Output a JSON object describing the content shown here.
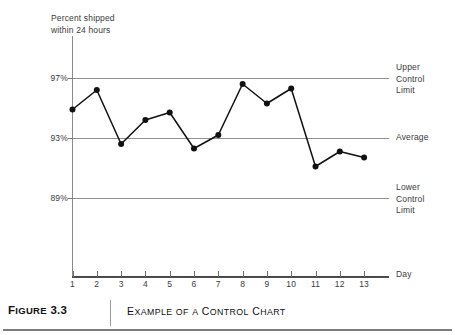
{
  "figure": {
    "number_label": "Figure 3.3",
    "number_prefix": "F",
    "number_rest": "IGURE",
    "number_value": "3.3",
    "caption": "Example of a Control Chart",
    "caption_parts": [
      "E",
      "XAMPLE",
      "OF",
      "A",
      "C",
      "ONTROL",
      "C",
      "HART"
    ]
  },
  "chart_data": {
    "type": "line",
    "title": "",
    "subtitle": "",
    "xlabel": "Day",
    "ylabel": "Percent shipped\nwithin 24 hours",
    "ylabel_line1": "Percent shipped",
    "ylabel_line2": "within 24 hours",
    "x": [
      1,
      2,
      3,
      4,
      5,
      6,
      7,
      8,
      9,
      10,
      11,
      12,
      13
    ],
    "categories": [
      "1",
      "2",
      "3",
      "4",
      "5",
      "6",
      "7",
      "8",
      "9",
      "10",
      "11",
      "12",
      "13"
    ],
    "values": [
      94.9,
      96.2,
      92.6,
      94.2,
      94.7,
      92.3,
      93.2,
      96.6,
      95.3,
      96.3,
      91.1,
      92.1,
      91.7
    ],
    "series": [
      {
        "name": "Percent shipped within 24 hours",
        "values": [
          94.9,
          96.2,
          92.6,
          94.2,
          94.7,
          92.3,
          93.2,
          96.6,
          95.3,
          96.3,
          91.1,
          92.1,
          91.7
        ]
      }
    ],
    "ylim": [
      85.0,
      98.0
    ],
    "xlim": [
      1,
      13
    ],
    "ytick_values": [
      97,
      93,
      89
    ],
    "ytick_labels": [
      "97%",
      "93%",
      "89%"
    ],
    "grid": true,
    "legend": "none",
    "marker": "filled-circle",
    "line_color": "#111111",
    "grid_color": "#8f8f8f",
    "reference_lines": [
      {
        "id": "ucl",
        "value": 97,
        "label": "Upper\nControl\nLimit",
        "label_line1": "Upper",
        "label_line2": "Control",
        "label_line3": "Limit"
      },
      {
        "id": "average",
        "value": 93,
        "label": "Average",
        "label_line1": "Average"
      },
      {
        "id": "lcl",
        "value": 89,
        "label": "Lower\nControl\nLimit",
        "label_line1": "Lower",
        "label_line2": "Control",
        "label_line3": "Limit"
      }
    ]
  }
}
